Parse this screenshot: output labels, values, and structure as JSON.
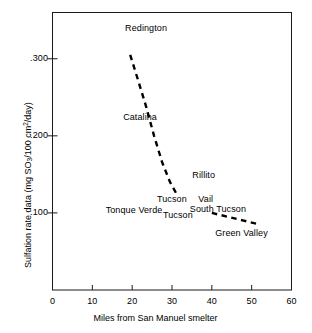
{
  "chart_data": {
    "type": "line",
    "title": "",
    "xlabel": "Miles from San Manuel smelter",
    "ylabel": "Sulfation rate data (mg SO3/100 cm2/day)",
    "ylabel_parts": {
      "prefix": "Sulfation rate data (mg SO",
      "sub1": "3",
      "mid": "/100 cm",
      "sup1": "2",
      "suffix": "/day)"
    },
    "xlim": [
      0,
      60
    ],
    "ylim": [
      0,
      0.36
    ],
    "xticks": [
      0,
      10,
      20,
      30,
      40,
      50,
      60
    ],
    "xtick_labels": [
      "0",
      "10",
      "20",
      "30",
      "40",
      "50",
      "60"
    ],
    "yticks": [
      0.1,
      0.2,
      0.3
    ],
    "ytick_labels": [
      ".100",
      ".200",
      ".300"
    ],
    "grid": false,
    "legend": false,
    "line_style": "dashed",
    "series": [
      {
        "name": "upper trend",
        "x": [
          19.5,
          21.5,
          23.5,
          25.5,
          27.5,
          29.5,
          31.0
        ],
        "values": [
          0.305,
          0.272,
          0.238,
          0.2,
          0.166,
          0.14,
          0.126
        ]
      },
      {
        "name": "lower trend",
        "x": [
          40.0,
          44.0,
          48.0,
          52.0
        ],
        "values": [
          0.1,
          0.095,
          0.09,
          0.085
        ]
      }
    ],
    "annotations": [
      {
        "text": "Redington",
        "x": 23.5,
        "y": 0.338
      },
      {
        "text": "Catalina",
        "x": 22.0,
        "y": 0.223
      },
      {
        "text": "Rillito",
        "x": 38.0,
        "y": 0.148
      },
      {
        "text": "Tucson",
        "x": 30.0,
        "y": 0.117
      },
      {
        "text": "Vail",
        "x": 38.5,
        "y": 0.117
      },
      {
        "text": "Tonque Verde",
        "x": 20.5,
        "y": 0.102
      },
      {
        "text": "South Tucson",
        "x": 41.5,
        "y": 0.104
      },
      {
        "text": "Tucson",
        "x": 31.5,
        "y": 0.096
      },
      {
        "text": "Green Valley",
        "x": 47.5,
        "y": 0.073
      }
    ]
  }
}
